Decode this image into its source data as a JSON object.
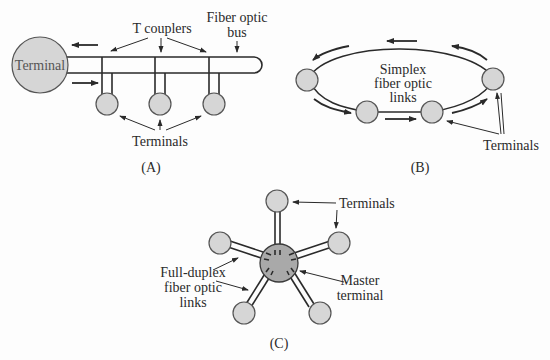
{
  "figure": {
    "panels": [
      {
        "id": "A",
        "caption": "(A)",
        "topology": "bus",
        "labels": {
          "main_terminal": "Terminal",
          "couplers": "T couplers",
          "bus_line1": "Fiber optic",
          "bus_line2": "bus",
          "terminals": "Terminals"
        }
      },
      {
        "id": "B",
        "caption": "(B)",
        "topology": "ring",
        "labels": {
          "links_line1": "Simplex",
          "links_line2": "fiber optic",
          "links_line3": "links",
          "terminals": "Terminals"
        }
      },
      {
        "id": "C",
        "caption": "(C)",
        "topology": "star",
        "labels": {
          "terminals": "Terminals",
          "links_line1": "Full-duplex",
          "links_line2": "fiber optic",
          "links_line3": "links",
          "master_line1": "Master",
          "master_line2": "terminal"
        }
      }
    ],
    "colors": {
      "terminal_fill": "#d6d6d6",
      "master_fill": "#a9a9a9",
      "stroke": "#2a2a2a",
      "background": "#fdfdfd"
    }
  }
}
